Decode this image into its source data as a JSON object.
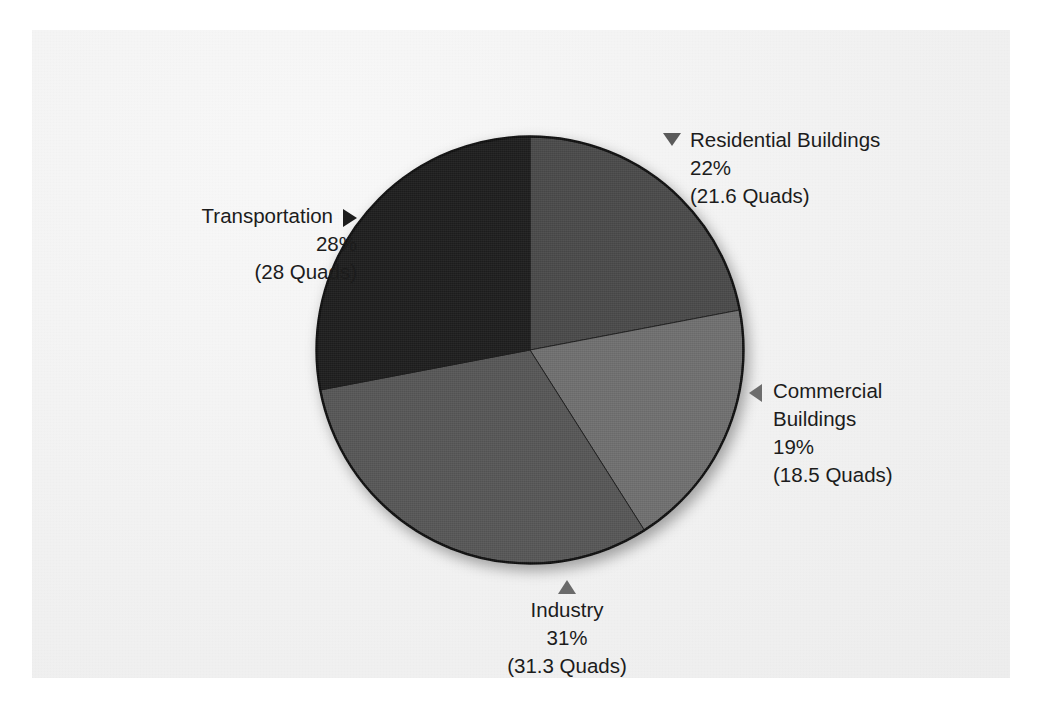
{
  "chart_data": {
    "type": "pie",
    "title": "",
    "subtitle": "",
    "unit": "Quads",
    "legend_position": "callout-labels",
    "total_quads": 99.4,
    "start_angle_deg": 0,
    "direction": "clockwise",
    "categories": [
      "Residential Buildings",
      "Commercial Buildings",
      "Industry",
      "Transportation"
    ],
    "values": [
      22,
      19,
      31,
      28
    ],
    "value_labels": [
      "22%",
      "19%",
      "31%",
      "28%"
    ],
    "absolute_values": [
      21.6,
      18.5,
      31.3,
      28
    ],
    "absolute_labels": [
      "(21.6 Quads)",
      "(18.5 Quads)",
      "(31.3 Quads)",
      "(28 Quads)"
    ],
    "colors": [
      "#4a4a4a",
      "#707070",
      "#575757",
      "#1e1e1e"
    ],
    "slices": [
      {
        "name": "Residential Buildings",
        "percent": 22,
        "percent_label": "22%",
        "quads": 21.6,
        "quads_label": "(21.6 Quads)",
        "color": "#4a4a4a",
        "start_deg": 0,
        "end_deg": 79.2,
        "marker": "triangle-down-icon"
      },
      {
        "name": "Commercial Buildings",
        "percent": 19,
        "percent_label": "19%",
        "quads": 18.5,
        "quads_label": "(18.5 Quads)",
        "color": "#707070",
        "start_deg": 79.2,
        "end_deg": 147.6,
        "marker": "triangle-left-icon"
      },
      {
        "name": "Industry",
        "percent": 31,
        "percent_label": "31%",
        "quads": 31.3,
        "quads_label": "(31.3 Quads)",
        "color": "#575757",
        "start_deg": 147.6,
        "end_deg": 259.2,
        "marker": "triangle-up-icon"
      },
      {
        "name": "Transportation",
        "percent": 28,
        "percent_label": "28%",
        "quads": 28,
        "quads_label": "(28 Quads)",
        "color": "#1e1e1e",
        "start_deg": 259.2,
        "end_deg": 360,
        "marker": "triangle-right-icon"
      }
    ]
  },
  "callouts": {
    "residential": {
      "name": "Residential Buildings",
      "percent_label": "22%",
      "quads_label": "(21.6 Quads)"
    },
    "commercial": {
      "name_line1": "Commercial",
      "name_line2": "Buildings",
      "percent_label": "19%",
      "quads_label": "(18.5 Quads)"
    },
    "industry": {
      "name": "Industry",
      "percent_label": "31%",
      "quads_label": "(31.3 Quads)"
    },
    "transportation": {
      "name": "Transportation",
      "percent_label": "28%",
      "quads_label": "(28 Quads)"
    }
  },
  "colors": {
    "page_background": "#ffffff",
    "panel_background": "#f2f2f2",
    "text": "#1c1c1c",
    "pie_outline": "#101010"
  }
}
